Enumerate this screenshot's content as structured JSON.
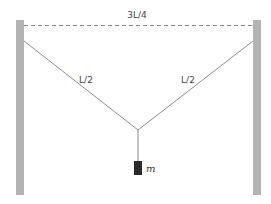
{
  "diagram": {
    "type": "physics-statics",
    "labels": {
      "wall_separation": "3L/4",
      "left_string": "L/2",
      "right_string": "L/2",
      "mass": "m"
    },
    "colors": {
      "wall": "#b3b3b3",
      "string": "#6e6e6e",
      "dashed": "#8a8a8a",
      "mass": "#2a2a2a",
      "background": "#ffffff"
    }
  }
}
